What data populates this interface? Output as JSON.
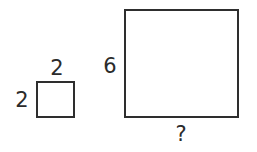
{
  "diagram": {
    "small_square": {
      "top_label": "2",
      "left_label": "2"
    },
    "large_square": {
      "left_label": "6",
      "bottom_label": "?"
    }
  }
}
